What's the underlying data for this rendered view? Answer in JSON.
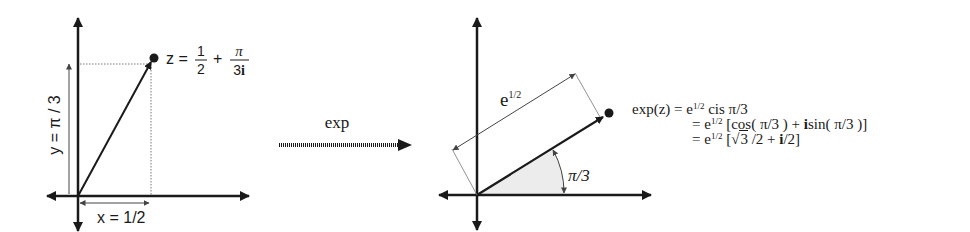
{
  "diagram": {
    "colors": {
      "axis": "#1a1a1a",
      "vector": "#1a1a1a",
      "dimension_line": "#555555",
      "dotted_guide": "#777777",
      "angle_fill": "#e9e9e9"
    },
    "left_plane": {
      "point_label_prefix": "z =",
      "point_frac1_num": "1",
      "point_frac1_den": "2",
      "point_plus": "+",
      "point_frac2_num": "π",
      "point_frac2_den_num": "3",
      "point_frac2_den_i": "i",
      "x_label": "x = 1/2",
      "y_label": "y = π / 3"
    },
    "mapping": {
      "label": "exp"
    },
    "right_plane": {
      "magnitude_label_base": "e",
      "magnitude_label_exp": "1/2",
      "angle_label": "π/3"
    },
    "equations": {
      "line1_lhs": "exp(z) = e",
      "line1_exp": "1/2",
      "line1_rhs": " cis π/3",
      "line2_lhs": "= e",
      "line2_exp": "1/2",
      "line2_rhs_a": " [cos( π/3 ) +  ",
      "line2_i": "i",
      "line2_rhs_b": "sin( π/3 )]",
      "line3_lhs": "= e",
      "line3_exp": "1/2",
      "line3_rhs_a": " [",
      "line3_sqrt_sym": "√",
      "line3_sqrt_arg": "3",
      "line3_rhs_b": " /2 +  ",
      "line3_i": "i",
      "line3_rhs_c": "/2]"
    }
  }
}
